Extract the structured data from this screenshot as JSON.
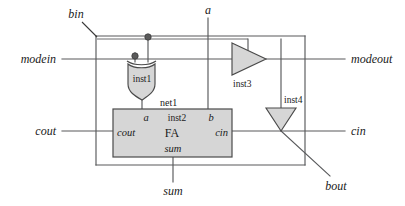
{
  "diagram": {
    "colors": {
      "background": "#ffffff",
      "wire": "#58595b",
      "shape_fill": "#d6d6d6",
      "shape_stroke": "#4a4a4a",
      "text": "#1a1a1a",
      "junction": "#5a5a5a"
    },
    "io_ports": {
      "bin": "bin",
      "a": "a",
      "modein": "modein",
      "modeout": "modeout",
      "cout": "cout",
      "cin": "cin",
      "sum": "sum",
      "bout": "bout"
    },
    "instances": {
      "inst1": "inst1",
      "inst2": "inst2",
      "inst3": "inst3",
      "inst4": "inst4"
    },
    "nets": {
      "net1": "net1"
    },
    "fa_block": {
      "type": "FA",
      "port_a": "a",
      "port_b": "b",
      "port_cout": "cout",
      "port_cin": "cin",
      "port_sum": "sum"
    }
  }
}
